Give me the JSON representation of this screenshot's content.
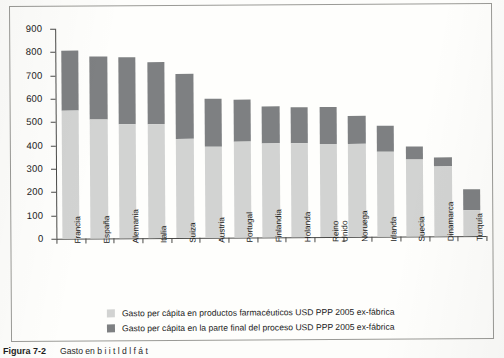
{
  "chart_data": {
    "type": "bar",
    "subtype": "stacked",
    "title": "",
    "xlabel": "",
    "ylabel": "",
    "ylim": [
      0,
      900
    ],
    "ytick_step": 100,
    "yticks": [
      0,
      100,
      200,
      300,
      400,
      500,
      600,
      700,
      800,
      900
    ],
    "grid": false,
    "legend_position": "bottom",
    "categories": [
      "Francia",
      "España",
      "Alemania",
      "Italia",
      "Suiza",
      "Austria",
      "Portugal",
      "Finlandia",
      "Holanda",
      "Reino\nUnido",
      "Noruega",
      "Irlanda",
      "Suecia",
      "Dinamarca",
      "Turquía"
    ],
    "series": [
      {
        "name": "Gasto per cápita en productos farmacéuticos USD PPP 2005 ex-fábrica",
        "color": "#d2d3d2",
        "values": [
          548,
          508,
          487,
          487,
          425,
          388,
          410,
          405,
          402,
          400,
          398,
          365,
          330,
          300,
          113
        ]
      },
      {
        "name": "Gasto per cápita en la parte final del proceso USD PPP 2005 ex-fábrica",
        "color": "#7e8082",
        "values": [
          256,
          272,
          288,
          268,
          280,
          207,
          183,
          155,
          157,
          158,
          122,
          110,
          57,
          40,
          87
        ]
      }
    ],
    "totals": [
      804,
      780,
      775,
      755,
      705,
      595,
      593,
      560,
      559,
      558,
      520,
      475,
      387,
      340,
      200
    ]
  },
  "legend": {
    "items": [
      {
        "swatch": "light",
        "label": "Gasto per cápita en productos farmacéuticos USD PPP 2005 ex-fábrica"
      },
      {
        "swatch": "dark",
        "label": "Gasto per cápita en la parte final del proceso USD PPP 2005 ex-fábrica"
      }
    ]
  },
  "caption": {
    "label": "Figura 7-2",
    "text": "Gasto en  b            i  i  t  l  d  l  f  á  t"
  }
}
